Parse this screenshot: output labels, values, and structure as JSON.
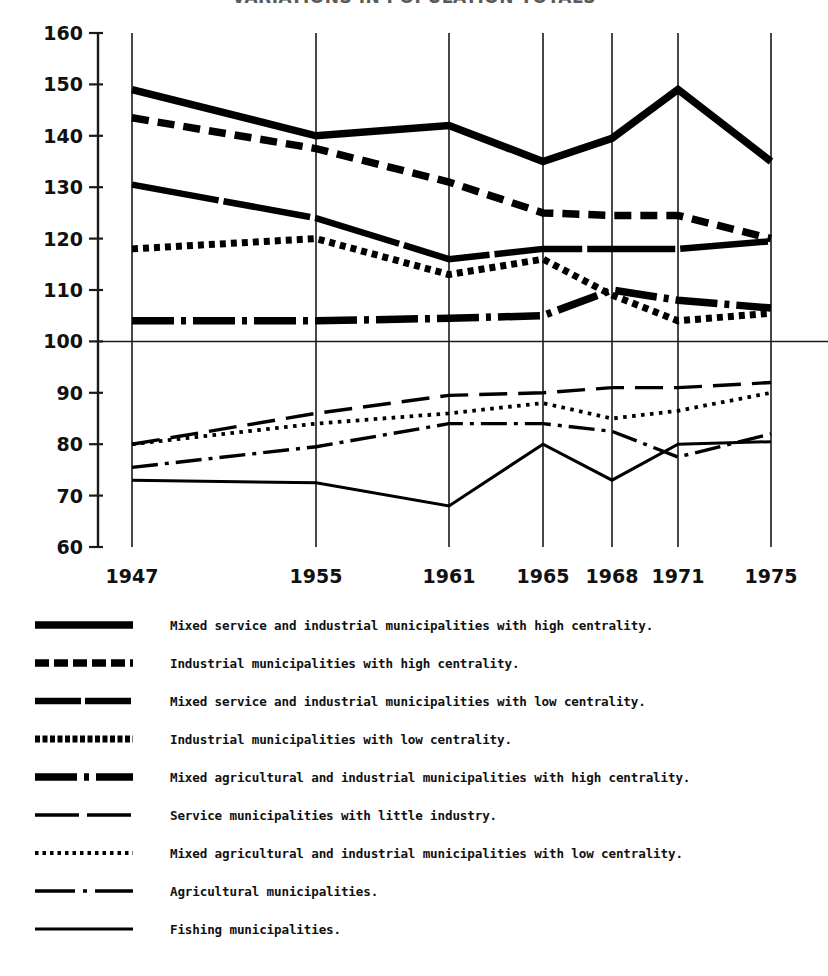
{
  "title": "VARIATIONS IN POPULATION TOTALS",
  "chart_data": {
    "type": "line",
    "title": "VARIATIONS IN POPULATION TOTALS",
    "xlabel": "",
    "ylabel": "",
    "x": [
      1947,
      1955,
      1961,
      1965,
      1968,
      1971,
      1975
    ],
    "categories": [
      "1947",
      "1955",
      "1961",
      "1965",
      "1968",
      "1971",
      "1975"
    ],
    "xlim": [
      1947,
      1975
    ],
    "ylim": [
      60,
      160
    ],
    "yticks": [
      60,
      70,
      80,
      90,
      100,
      110,
      120,
      130,
      140,
      150,
      160
    ],
    "grid": "vertical gridlines at each year plus horizontal reference line at 100",
    "reference_line": 100,
    "legend_position": "below plot",
    "series": [
      {
        "name": "Mixed service and industrial municipalities with high centrality.",
        "style": "thick-solid",
        "values": [
          149,
          140,
          142,
          135,
          139.5,
          149,
          135
        ]
      },
      {
        "name": "Industrial municipalities with high centrality.",
        "style": "heavy-dash",
        "values": [
          143.5,
          137.5,
          131,
          125,
          124.5,
          124.5,
          120
        ]
      },
      {
        "name": "Mixed service and industrial municipalities with low centrality.",
        "style": "thick-solid-gapped",
        "values": [
          130.5,
          124,
          116,
          118,
          118,
          118,
          119.5
        ]
      },
      {
        "name": "Industrial municipalities with low centrality.",
        "style": "square-dotted",
        "values": [
          118,
          120,
          113,
          116,
          109,
          104,
          105.5
        ]
      },
      {
        "name": "Mixed agricultural and industrial municipalities with high centrality.",
        "style": "thick-dash-dot",
        "values": [
          104,
          104,
          104.5,
          105,
          110,
          108,
          106.5
        ]
      },
      {
        "name": "Service municipalities with little industry.",
        "style": "long-dash",
        "values": [
          80,
          86,
          89.5,
          90,
          91,
          91,
          92
        ]
      },
      {
        "name": "Mixed agricultural and industrial municipalities with low centrality.",
        "style": "fine-dotted",
        "values": [
          80,
          84,
          86,
          88,
          85,
          86.5,
          90
        ]
      },
      {
        "name": "Agricultural municipalities.",
        "style": "thin-dash-dot",
        "values": [
          75.5,
          79.5,
          84,
          84,
          82.5,
          77.5,
          82
        ]
      },
      {
        "name": "Fishing municipalities.",
        "style": "thin-solid",
        "values": [
          73,
          72.5,
          68,
          80,
          73,
          80,
          80.5
        ]
      }
    ]
  },
  "legend": {
    "items": [
      {
        "label": "Mixed service and industrial municipalities with high centrality.",
        "swatch": "thick-solid"
      },
      {
        "label": "Industrial municipalities with high centrality.",
        "swatch": "heavy-dash"
      },
      {
        "label": "Mixed service and industrial municipalities with low centrality.",
        "swatch": "thick-solid-gapped"
      },
      {
        "label": "Industrial municipalities with low centrality.",
        "swatch": "square-dotted"
      },
      {
        "label": "Mixed agricultural and industrial municipalities with high centrality.",
        "swatch": "thick-dash-dot"
      },
      {
        "label": "Service municipalities with little industry.",
        "swatch": "long-dash"
      },
      {
        "label": "Mixed agricultural and industrial municipalities with low centrality.",
        "swatch": "fine-dotted"
      },
      {
        "label": "Agricultural municipalities.",
        "swatch": "thin-dash-dot"
      },
      {
        "label": "Fishing municipalities.",
        "swatch": "thin-solid"
      }
    ]
  },
  "colors": {
    "ink": "#000000",
    "paper": "#ffffff",
    "axis": "#1a1a1a"
  }
}
